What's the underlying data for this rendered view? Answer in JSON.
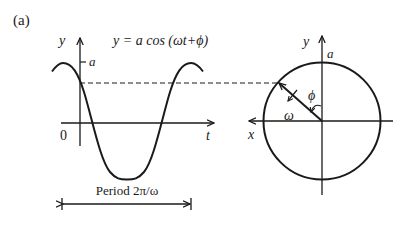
{
  "figure": {
    "panel_label": "(a)",
    "equation": "y = a cos (ωt+ϕ)",
    "colors": {
      "ink": "#1a1a1a",
      "background": "#ffffff"
    }
  },
  "wave_plot": {
    "y_axis_label": "y",
    "x_axis_label": "t",
    "origin_label": "0",
    "amplitude_label": "a",
    "period_label": "Period  2π/ω"
  },
  "phasor_circle": {
    "y_axis_label": "y",
    "x_axis_label": "x",
    "radius_label": "a",
    "angular_velocity_label": "ω",
    "phase_angle_label": "ϕ"
  }
}
